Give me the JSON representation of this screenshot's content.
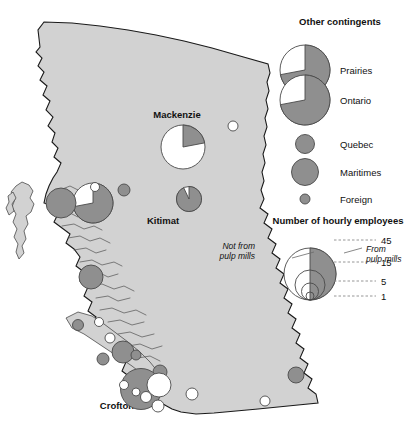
{
  "figure": {
    "type": "proportional-symbol-map",
    "region": "British Columbia",
    "colors": {
      "land": "#d2d2d2",
      "symbol_gray": "#8f8f8f",
      "symbol_white": "#ffffff",
      "outline": "#4a4a4a",
      "text": "#111111"
    }
  },
  "map": {
    "place_labels": [
      {
        "name": "Mackenzie",
        "text": "Mackenzie",
        "x": 177,
        "y": 118
      },
      {
        "name": "Kitimat",
        "text": "Kitimat",
        "x": 163,
        "y": 224
      },
      {
        "name": "Crofton",
        "text": "Crofton",
        "x": 117,
        "y": 409
      }
    ],
    "symbols": [
      {
        "id": "mackenzie",
        "label": "Mackenzie",
        "cx": 183,
        "cy": 147,
        "r": 22.0,
        "gray_fraction": 0.22,
        "from_pulp_mills": 10,
        "not_from_pulp_mills": 35,
        "total": 45
      },
      {
        "id": "kitimat",
        "label": "Kitimat",
        "cx": 189,
        "cy": 199,
        "r": 12.5,
        "gray_fraction": 0.93,
        "from_pulp_mills": 14,
        "not_from_pulp_mills": 1,
        "total": 15
      },
      {
        "id": "prince-rupert",
        "label": "Prince Rupert",
        "cx": 93,
        "cy": 203,
        "r": 20.0,
        "gray_fraction": 0.72,
        "from_pulp_mills": 26,
        "not_from_pulp_mills": 10,
        "total": 36
      },
      {
        "id": "pr-satellite",
        "label": "",
        "cx": 95,
        "cy": 187,
        "r": 4.5,
        "gray_fraction": 0.0,
        "from_pulp_mills": 0,
        "not_from_pulp_mills": 1,
        "total": 1
      },
      {
        "id": "terrace",
        "label": "",
        "cx": 61,
        "cy": 203,
        "r": 15.0,
        "gray_fraction": 1.0,
        "from_pulp_mills": 18,
        "not_from_pulp_mills": 0,
        "total": 18
      },
      {
        "id": "interior-dot",
        "label": "",
        "cx": 124,
        "cy": 190,
        "r": 6.0,
        "gray_fraction": 1.0,
        "from_pulp_mills": 3,
        "not_from_pulp_mills": 0,
        "total": 3
      },
      {
        "id": "ne-white",
        "label": "",
        "cx": 233,
        "cy": 126,
        "r": 5.0,
        "gray_fraction": 0.0,
        "from_pulp_mills": 0,
        "not_from_pulp_mills": 2,
        "total": 2
      },
      {
        "id": "bella-coola",
        "label": "",
        "cx": 91,
        "cy": 277,
        "r": 12.0,
        "gray_fraction": 1.0,
        "from_pulp_mills": 11,
        "not_from_pulp_mills": 0,
        "total": 11
      },
      {
        "id": "pt-hardy",
        "label": "",
        "cx": 78,
        "cy": 325,
        "r": 5.5,
        "gray_fraction": 1.0,
        "from_pulp_mills": 2,
        "not_from_pulp_mills": 0,
        "total": 2
      },
      {
        "id": "pt-alice",
        "label": "",
        "cx": 99,
        "cy": 322,
        "r": 4.5,
        "gray_fraction": 0.0,
        "from_pulp_mills": 0,
        "not_from_pulp_mills": 1,
        "total": 1
      },
      {
        "id": "campbell-wt",
        "label": "",
        "cx": 110,
        "cy": 338,
        "r": 5.0,
        "gray_fraction": 0.0,
        "from_pulp_mills": 0,
        "not_from_pulp_mills": 1,
        "total": 1
      },
      {
        "id": "powell-river",
        "label": "",
        "cx": 123,
        "cy": 352,
        "r": 11.0,
        "gray_fraction": 1.0,
        "from_pulp_mills": 9,
        "not_from_pulp_mills": 0,
        "total": 9
      },
      {
        "id": "pr-small",
        "label": "",
        "cx": 136,
        "cy": 355,
        "r": 5.0,
        "gray_fraction": 1.0,
        "from_pulp_mills": 2,
        "not_from_pulp_mills": 0,
        "total": 2
      },
      {
        "id": "nanaimo-sm",
        "label": "",
        "cx": 103,
        "cy": 359,
        "r": 6.0,
        "gray_fraction": 1.0,
        "from_pulp_mills": 3,
        "not_from_pulp_mills": 0,
        "total": 3
      },
      {
        "id": "gibsons",
        "label": "",
        "cx": 160,
        "cy": 372,
        "r": 7.0,
        "gray_fraction": 1.0,
        "from_pulp_mills": 4,
        "not_from_pulp_mills": 0,
        "total": 4
      },
      {
        "id": "crofton-main",
        "label": "Crofton",
        "cx": 141,
        "cy": 389,
        "r": 20.5,
        "gray_fraction": 1.0,
        "from_pulp_mills": 38,
        "not_from_pulp_mills": 0,
        "total": 38
      },
      {
        "id": "vancouver",
        "label": "",
        "cx": 159,
        "cy": 385,
        "r": 12.0,
        "gray_fraction": 0.0,
        "from_pulp_mills": 0,
        "not_from_pulp_mills": 11,
        "total": 11
      },
      {
        "id": "van-sm1",
        "label": "",
        "cx": 124,
        "cy": 385,
        "r": 4.5,
        "gray_fraction": 0.0,
        "from_pulp_mills": 0,
        "not_from_pulp_mills": 1,
        "total": 1
      },
      {
        "id": "van-sm2",
        "label": "",
        "cx": 136,
        "cy": 392,
        "r": 4.0,
        "gray_fraction": 0.0,
        "from_pulp_mills": 0,
        "not_from_pulp_mills": 1,
        "total": 1
      },
      {
        "id": "van-sm3",
        "label": "",
        "cx": 146,
        "cy": 397,
        "r": 5.5,
        "gray_fraction": 0.0,
        "from_pulp_mills": 0,
        "not_from_pulp_mills": 2,
        "total": 2
      },
      {
        "id": "van-sm4",
        "label": "",
        "cx": 158,
        "cy": 406,
        "r": 6.0,
        "gray_fraction": 0.0,
        "from_pulp_mills": 0,
        "not_from_pulp_mills": 2,
        "total": 2
      },
      {
        "id": "border-w1",
        "label": "",
        "cx": 192,
        "cy": 394,
        "r": 6.0,
        "gray_fraction": 0.0,
        "from_pulp_mills": 0,
        "not_from_pulp_mills": 2,
        "total": 2
      },
      {
        "id": "border-w2",
        "label": "",
        "cx": 265,
        "cy": 401,
        "r": 5.0,
        "gray_fraction": 0.0,
        "from_pulp_mills": 0,
        "not_from_pulp_mills": 1,
        "total": 1
      },
      {
        "id": "kootenay",
        "label": "",
        "cx": 296,
        "cy": 375,
        "r": 8.0,
        "gray_fraction": 1.0,
        "from_pulp_mills": 5,
        "not_from_pulp_mills": 0,
        "total": 5
      }
    ]
  },
  "legend_contingents": {
    "title": "Other contingents",
    "items": [
      {
        "name": "prairies",
        "label": "Prairies",
        "shape": "pie",
        "radius": 25.0,
        "gray_fraction": 0.72
      },
      {
        "name": "ontario",
        "label": "Ontario",
        "shape": "pie",
        "radius": 25.0,
        "gray_fraction": 0.72
      },
      {
        "name": "quebec",
        "label": "Quebec",
        "shape": "circle",
        "radius": 9.5,
        "gray_fraction": 1.0
      },
      {
        "name": "maritimes",
        "label": "Maritimes",
        "shape": "circle",
        "radius": 13.5,
        "gray_fraction": 1.0
      },
      {
        "name": "foreign",
        "label": "Foreign",
        "shape": "circle",
        "radius": 5.0,
        "gray_fraction": 1.0
      }
    ]
  },
  "legend_size": {
    "title": "Number of hourly employees",
    "annotation_left": "Not from\npulp mills",
    "annotation_left_line1": "Not from",
    "annotation_left_line2": "pulp mills",
    "annotation_right": "From\npulp mills",
    "annotation_right_line1": "From",
    "annotation_right_line2": "pulp mills",
    "ticks": [
      {
        "value": "45",
        "radius": 26.0
      },
      {
        "value": "15",
        "radius": 15.0
      },
      {
        "value": "5",
        "radius": 8.5
      },
      {
        "value": "1",
        "radius": 4.0
      }
    ]
  },
  "chart_data": {
    "type": "scatter",
    "title": "Number of hourly employees",
    "size_legend_values": [
      45,
      15,
      5,
      1
    ],
    "categories": [
      "Mackenzie",
      "Kitimat",
      "Crofton"
    ],
    "series": [
      {
        "name": "From pulp mills",
        "values": [
          10,
          14,
          38
        ]
      },
      {
        "name": "Not from pulp mills",
        "values": [
          35,
          1,
          0
        ]
      }
    ],
    "legend_position": "right",
    "grid": false
  }
}
